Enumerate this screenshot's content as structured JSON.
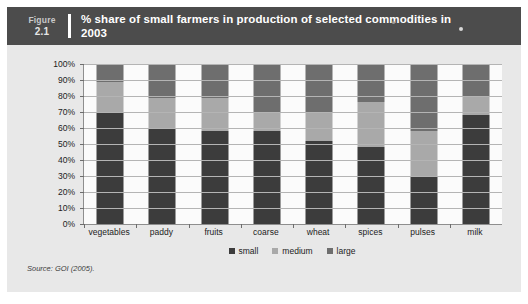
{
  "figure": {
    "label": "Figure",
    "number": "2.1",
    "title": "% share of small farmers in production of selected commodities in 2003",
    "source": "Source: GOI (2005)."
  },
  "colors": {
    "small": "#3c3c3c",
    "medium": "#a9a9a9",
    "large": "#6e6e6e",
    "header_band": "#4c4c4c",
    "panel_background": "#e8e8e8",
    "plot_background": "#fbfbfb",
    "gridline": "#b4b4b4",
    "axis": "#8e8e8e"
  },
  "chart_data": {
    "type": "bar",
    "stacked": true,
    "title": "% share of small farmers in production of selected commodities in 2003",
    "xlabel": "",
    "ylabel": "",
    "ylim": [
      0,
      100
    ],
    "yticks": [
      "0%",
      "10%",
      "20%",
      "30%",
      "40%",
      "50%",
      "60%",
      "70%",
      "80%",
      "90%",
      "100%"
    ],
    "grid": true,
    "legend_position": "bottom",
    "categories": [
      "vegetables",
      "paddy",
      "fruits",
      "coarse",
      "wheat",
      "spices",
      "pulses",
      "milk"
    ],
    "series": [
      {
        "name": "small",
        "color": "#3c3c3c",
        "values": [
          70,
          60,
          58,
          58,
          52,
          48,
          30,
          68
        ]
      },
      {
        "name": "medium",
        "color": "#a9a9a9",
        "values": [
          19,
          19,
          21,
          12,
          18,
          28,
          28,
          12
        ]
      },
      {
        "name": "large",
        "color": "#6e6e6e",
        "values": [
          11,
          21,
          21,
          30,
          30,
          24,
          42,
          20
        ]
      }
    ]
  }
}
